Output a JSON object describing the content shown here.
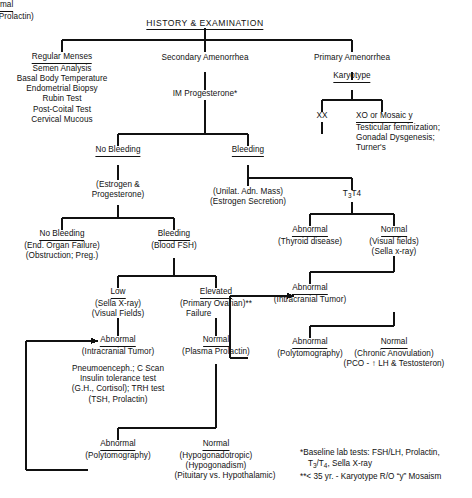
{
  "title": "HISTORY & EXAMINATION",
  "nodes": {
    "root": {
      "label": "HISTORY & EXAMINATION"
    },
    "regular_menses": {
      "heading": "Regular Menses",
      "lines": [
        "Semen Analysis",
        "Basal Body Temperature",
        "Endometrial Biopsy",
        "Rubin Test",
        "Post-Coital Test",
        "Cervical Mucous"
      ]
    },
    "secondary_amenorrhea": {
      "label": "Secondary Amenorrhea"
    },
    "primary_amenorrhea": {
      "label": "Primary Amenorrhea"
    },
    "karyotype": {
      "label": "Karyotype"
    },
    "im_progesterone": {
      "label": "IM Progesterone*"
    },
    "xx": {
      "label": "XX"
    },
    "xo_mosaic": {
      "heading": "XO or Mosaic y",
      "lines": [
        "Testicular feminization;",
        "Gonadal Dysgenesis;",
        "Turner's"
      ]
    },
    "no_bleeding_1": {
      "heading": "No Bleeding",
      "lines": [
        "(Estrogen &",
        "Progesterone)"
      ]
    },
    "bleeding_1": {
      "heading": "Bleeding",
      "lines": [
        "(Unilat. Adn. Mass)",
        "(Estrogen Secretion)"
      ]
    },
    "t3t4": {
      "label": "T3T4",
      "t": "T",
      "sub3": "3",
      "t4": "T4"
    },
    "no_bleeding_2": {
      "heading": "No Bleeding",
      "lines": [
        "(End. Organ Failure)",
        "(Obstruction; Preg.)"
      ]
    },
    "bleeding_2": {
      "heading": "Bleeding",
      "lines": [
        "(Blood FSH)"
      ]
    },
    "thyroid_abnormal": {
      "heading": "Abnormal",
      "lines": [
        "(Thyroid disease)"
      ]
    },
    "thyroid_normal": {
      "heading": "Normal",
      "lines": [
        "(Visual fields)",
        "(Sella x-ray)"
      ]
    },
    "fsh_low": {
      "heading": "Low",
      "lines": [
        "(Sella X-ray)",
        "(Visual Fields)"
      ]
    },
    "fsh_elevated": {
      "heading": "Elevated",
      "lines": [
        "(Primary Ovarian)**",
        "Failure"
      ]
    },
    "right_abnormal_tumor": {
      "heading": "Abnormal",
      "lines": [
        "(Intracranial Tumor)"
      ]
    },
    "right_normal_prolactin": {
      "heading": "Normal",
      "lines": [
        "(Plasma Prolactin)"
      ]
    },
    "left_abnormal_tumor": {
      "heading": "Abnormal",
      "lines": [
        "(Intracranial Tumor)"
      ]
    },
    "left_normal_prolactin": {
      "heading": "Normal",
      "lines": [
        "(Plasma Prolactin)"
      ]
    },
    "workup_tests": {
      "lines": [
        "Pneumoenceph.; C Scan",
        "Insulin tolerance test",
        "(G.H., Cortisol); TRH test",
        "(TSH, Prolactin)"
      ]
    },
    "right_abnormal_poly": {
      "heading": "Abnormal",
      "lines": [
        "(Polytomography)"
      ]
    },
    "right_normal_anovulation": {
      "heading": "Normal",
      "lines": [
        "(Chronic Anovulation)",
        "(PCO - ↑ LH & Testosteron)"
      ]
    },
    "bottom_abnormal_poly": {
      "heading": "Abnormal",
      "lines": [
        "(Polytomography)"
      ]
    },
    "bottom_normal_hypogonad": {
      "heading": "Normal",
      "lines": [
        "(Hypogonadotropic)",
        "(Hypogonadism)",
        "(Pituitary vs. Hypothalamic)"
      ]
    }
  },
  "footnotes": {
    "line1": "*Baseline lab tests:  FSH/LH, Prolactin,",
    "line2": "T3/T4, Sella X-ray",
    "line2_pre": "T",
    "line2_s1": "3",
    "line2_mid": "/T",
    "line2_s2": "4",
    "line2_post": ", Sella X-ray",
    "line3": "**< 35 yr. - Karyotype R/O “y” Mosaism"
  },
  "style": {
    "line_color": "#111111",
    "text_color": "#111111",
    "background": "#ffffff"
  }
}
